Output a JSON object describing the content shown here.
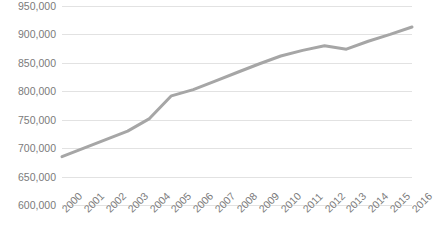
{
  "chart_data": {
    "type": "line",
    "title": "",
    "xlabel": "",
    "ylabel": "",
    "x": [
      2000,
      2001,
      2002,
      2003,
      2004,
      2005,
      2006,
      2007,
      2008,
      2009,
      2010,
      2011,
      2012,
      2013,
      2014,
      2015,
      2016
    ],
    "categories": [
      "2000",
      "2001",
      "2002",
      "2003",
      "2004",
      "2005",
      "2006",
      "2007",
      "2008",
      "2009",
      "2010",
      "2011",
      "2012",
      "2013",
      "2014",
      "2015",
      "2016"
    ],
    "values": [
      685000,
      700000,
      715000,
      730000,
      752000,
      792000,
      803000,
      818000,
      833000,
      848000,
      862000,
      872000,
      880000,
      874000,
      888000,
      900000,
      913000
    ],
    "series": [
      {
        "name": "Population",
        "values": [
          685000,
          700000,
          715000,
          730000,
          752000,
          792000,
          803000,
          818000,
          833000,
          848000,
          862000,
          872000,
          880000,
          874000,
          888000,
          900000,
          913000
        ],
        "color": "#a6a6a6"
      }
    ],
    "ylim": [
      600000,
      950000
    ],
    "ytick_step": 50000,
    "ytick_labels": [
      "950,000",
      "900,000",
      "850,000",
      "800,000",
      "750,000",
      "700,000",
      "650,000",
      "600,000"
    ],
    "ytick_values": [
      950000,
      900000,
      850000,
      800000,
      750000,
      700000,
      650000,
      600000
    ],
    "xlim": [
      2000,
      2016
    ],
    "grid": "horizontal",
    "legend": "none",
    "line_color": "#a6a6a6",
    "grid_color": "#e2e2e2",
    "tick_label_color": "#7b7b7b",
    "x_label_rotation": -45
  }
}
